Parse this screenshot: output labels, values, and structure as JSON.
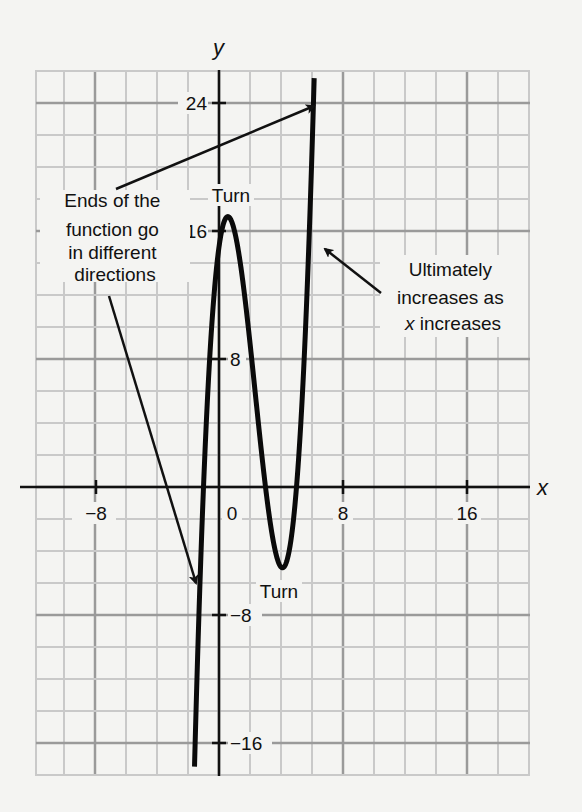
{
  "chart_data": {
    "type": "line",
    "title": "",
    "xlabel": "x",
    "ylabel": "y",
    "xlim": [
      -12,
      20
    ],
    "ylim": [
      -18,
      26
    ],
    "grid": true,
    "grid_minor_step": 2,
    "grid_major_step": 8,
    "x_ticks": [
      -8,
      0,
      8,
      16
    ],
    "x_tick_labels": [
      "−8",
      "0",
      "8",
      "16"
    ],
    "y_ticks": [
      24,
      16,
      8,
      -8,
      -16
    ],
    "y_tick_labels": [
      "24",
      "16",
      "8",
      "−8",
      "−16"
    ],
    "series": [
      {
        "name": "cubic function",
        "formula": "f(x) = (x+1)(x-3)(x-5)",
        "x": [
          -2.2,
          -2,
          -1.5,
          -1,
          -0.5,
          0,
          0.57,
          1,
          1.5,
          2,
          2.5,
          3,
          3.5,
          4.1,
          4.5,
          5,
          5.5,
          6,
          6.5
        ],
        "y": [
          -23.7,
          -21,
          -13.1,
          0,
          9.6,
          15,
          16.9,
          16,
          12.9,
          9,
          4.9,
          0,
          -3.4,
          -5.0,
          -4.4,
          0,
          6.1,
          21,
          38.5
        ]
      }
    ],
    "key_points": {
      "local_max": {
        "x": 0.6,
        "y": 17,
        "label": "Turn"
      },
      "local_min": {
        "x": 4.1,
        "y": -5,
        "label": "Turn"
      },
      "roots": [
        -1,
        3,
        5
      ]
    },
    "annotations": [
      {
        "id": "ends",
        "lines": [
          "Ends of the",
          "function go",
          "in different",
          "directions"
        ],
        "arrows_to": [
          {
            "x": 6.2,
            "y": 23.8
          },
          {
            "x": -1.5,
            "y": -6
          }
        ]
      },
      {
        "id": "increases",
        "lines": [
          "Ultimately",
          "increases as",
          "x increases"
        ],
        "arrows_to": [
          {
            "x": 6.6,
            "y": 15.3
          }
        ]
      },
      {
        "id": "turn-top",
        "text": "Turn"
      },
      {
        "id": "turn-bottom",
        "text": "Turn"
      }
    ]
  },
  "labels": {
    "x_axis": "x",
    "y_axis": "y",
    "turn_top": "Turn",
    "turn_bottom": "Turn",
    "ends_1": "Ends of the",
    "ends_2": "function go",
    "ends_3": "in different",
    "ends_4": "directions",
    "incr_1": "Ultimately",
    "incr_2": "increases as",
    "incr_3_italic": "x",
    "incr_3_rest": " increases",
    "tick_x_m8": "−8",
    "tick_x_0": "0",
    "tick_x_8": "8",
    "tick_x_16": "16",
    "tick_y_24": "24",
    "tick_y_16": "16",
    "tick_y_8": "8",
    "tick_y_m8": "−8",
    "tick_y_m16": "−16"
  }
}
